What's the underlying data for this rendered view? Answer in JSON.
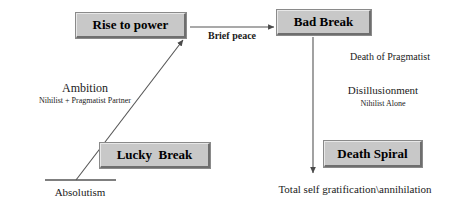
{
  "diagram": {
    "title_text": "",
    "boxes": [
      {
        "id": "rise-to-power",
        "label": "Rise to power",
        "x": 76,
        "y": 13,
        "w": 110,
        "h": 25,
        "font_size": 13
      },
      {
        "id": "bad-break",
        "label": "Bad Break",
        "x": 277,
        "y": 10,
        "w": 94,
        "h": 25,
        "font_size": 13
      },
      {
        "id": "lucky-break",
        "label": "Lucky  Break",
        "x": 100,
        "y": 143,
        "w": 110,
        "h": 25,
        "font_size": 13
      },
      {
        "id": "death-spiral",
        "label": "Death Spiral",
        "x": 324,
        "y": 141,
        "w": 98,
        "h": 26,
        "font_size": 13
      }
    ],
    "labels": [
      {
        "id": "brief-peace",
        "text": "Brief peace",
        "x": 232,
        "y": 31,
        "font_size": 10,
        "bold": true,
        "center": true
      },
      {
        "id": "ambition",
        "text": "Ambition",
        "x": 85,
        "y": 82,
        "font_size": 12,
        "bold": false,
        "center": true
      },
      {
        "id": "ambition-sub",
        "text": "Nihilist + Pragmatist Partner",
        "x": 85,
        "y": 97,
        "font_size": 8,
        "bold": false,
        "center": true
      },
      {
        "id": "absolutism",
        "text": "Absolutism",
        "x": 80,
        "y": 187,
        "font_size": 11,
        "bold": false,
        "center": true
      },
      {
        "id": "death-of-pragmatist",
        "text": "Death of Pragmatist",
        "x": 390,
        "y": 52,
        "font_size": 10,
        "bold": false,
        "center": true
      },
      {
        "id": "disillusionment",
        "text": "Disillusionment",
        "x": 383,
        "y": 85,
        "font_size": 11,
        "bold": false,
        "center": true
      },
      {
        "id": "disillusionment-sub",
        "text": "Nihilist Alone",
        "x": 383,
        "y": 100,
        "font_size": 8,
        "bold": false,
        "center": true
      },
      {
        "id": "total-self",
        "text": "Total self gratification\\annihilation",
        "x": 355,
        "y": 184,
        "font_size": 11,
        "bold": false,
        "center": true
      }
    ],
    "connectors": [
      {
        "id": "baseline",
        "kind": "line",
        "x1": 45,
        "y1": 180,
        "x2": 116,
        "y2": 180
      },
      {
        "id": "ambition-arrow",
        "kind": "arrow",
        "x1": 76,
        "y1": 180,
        "x2": 183,
        "y2": 40
      },
      {
        "id": "brief-peace-arrow",
        "kind": "arrow",
        "x1": 190,
        "y1": 27,
        "x2": 274,
        "y2": 27
      },
      {
        "id": "bad-break-arrow",
        "kind": "arrow",
        "x1": 313,
        "y1": 37,
        "x2": 313,
        "y2": 173
      }
    ],
    "colors": {
      "box_fill": "#c8c8c8",
      "box_border_dark": "#6e6e6e",
      "box_border_light": "#e8e8e8",
      "line": "#555555",
      "text": "#1a1a1a",
      "background": "#ffffff"
    }
  }
}
